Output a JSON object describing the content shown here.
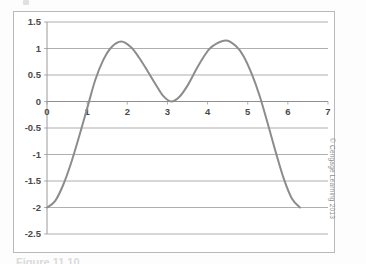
{
  "figure": {
    "caption": "Figure 11.10",
    "credit": "© Cengage Learning 2013"
  },
  "chart_data": {
    "type": "line",
    "title": "",
    "xlabel": "",
    "ylabel": "",
    "xlim": [
      0,
      7
    ],
    "ylim": [
      -2.5,
      1.5
    ],
    "grid": true,
    "grid_axis": "y",
    "legend": null,
    "line_color": "#8c8c8c",
    "xticks": [
      0,
      1,
      2,
      3,
      4,
      5,
      6,
      7
    ],
    "xtick_labels": [
      "0",
      "1",
      "2",
      "3",
      "4",
      "5",
      "6",
      "7"
    ],
    "yticks": [
      1.5,
      1,
      0.5,
      0,
      -0.5,
      -1,
      -1.5,
      -2,
      -2.5
    ],
    "ytick_labels": [
      "1.5",
      "1",
      "0.5",
      "0",
      "-0.5",
      "-1",
      "-1.5",
      "-2",
      "-2.5"
    ],
    "x": [
      0,
      0.2,
      0.4,
      0.6,
      0.8,
      1,
      1.2,
      1.4,
      1.6,
      1.85,
      2.1,
      2.3,
      2.5,
      2.7,
      2.9,
      3.1,
      3.3,
      3.5,
      3.7,
      3.9,
      4.1,
      4.45,
      4.7,
      4.9,
      5.1,
      5.3,
      5.5,
      5.7,
      5.9,
      6.1,
      6.3
    ],
    "values": [
      -2,
      -1.88,
      -1.58,
      -1.16,
      -0.66,
      -0.13,
      0.4,
      0.78,
      1.02,
      1.13,
      1.02,
      0.82,
      0.58,
      0.33,
      0.1,
      0.0,
      0.09,
      0.3,
      0.58,
      0.84,
      1.03,
      1.15,
      1.05,
      0.85,
      0.52,
      0.1,
      -0.42,
      -0.96,
      -1.46,
      -1.83,
      -2
    ],
    "peaks": [
      {
        "x": 1.85,
        "y": 1.13
      },
      {
        "x": 4.45,
        "y": 1.15
      }
    ],
    "valley": {
      "x": 3.1,
      "y": 0.0
    },
    "endpoints": [
      {
        "x": 0,
        "y": -2
      },
      {
        "x": 6.3,
        "y": -2
      }
    ]
  }
}
